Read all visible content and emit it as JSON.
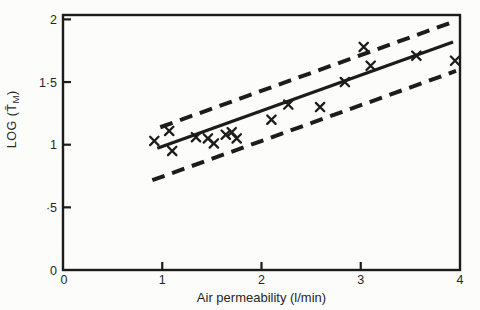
{
  "figure": {
    "background": "#fcfcfa",
    "ink": "#1c1c1c",
    "text_color": "#262626"
  },
  "chart_data": {
    "type": "scatter",
    "title": "",
    "xlabel": "Air permeability (l/min)",
    "ylabel": "LOG (T̄M)",
    "ylabel_parts": {
      "pre": "LOG (T̄",
      "sub": "M",
      "post": ")"
    },
    "xlim": [
      0,
      4
    ],
    "ylim": [
      0,
      2
    ],
    "grid": false,
    "legend": null,
    "marker": "x",
    "x_ticks": [
      {
        "value": 0,
        "label": "0"
      },
      {
        "value": 1,
        "label": "1"
      },
      {
        "value": 2,
        "label": "2"
      },
      {
        "value": 3,
        "label": "3"
      },
      {
        "value": 4,
        "label": "4"
      }
    ],
    "y_ticks": [
      {
        "value": 0,
        "label": "0"
      },
      {
        "value": 0.5,
        "label": "·5"
      },
      {
        "value": 1,
        "label": "1"
      },
      {
        "value": 1.5,
        "label": "1·5"
      },
      {
        "value": 2,
        "label": "2"
      }
    ],
    "points": [
      [
        0.92,
        1.03
      ],
      [
        1.07,
        1.11
      ],
      [
        1.1,
        0.95
      ],
      [
        1.34,
        1.06
      ],
      [
        1.46,
        1.05
      ],
      [
        1.52,
        1.01
      ],
      [
        1.64,
        1.08
      ],
      [
        1.7,
        1.1
      ],
      [
        1.75,
        1.05
      ],
      [
        2.1,
        1.2
      ],
      [
        2.27,
        1.32
      ],
      [
        2.59,
        1.3
      ],
      [
        2.84,
        1.5
      ],
      [
        3.03,
        1.78
      ],
      [
        3.1,
        1.63
      ],
      [
        3.56,
        1.71
      ],
      [
        3.95,
        1.67
      ]
    ],
    "regression_line": {
      "name": "fit-line",
      "slope": 0.285,
      "intercept": 0.7,
      "x_start": 0.95,
      "x_end": 3.93,
      "style": "solid"
    },
    "bands": [
      {
        "name": "upper-band",
        "slope": 0.285,
        "intercept": 0.86,
        "x_start": 0.98,
        "x_end": 3.95,
        "style": "dashed"
      },
      {
        "name": "lower-band",
        "slope": 0.285,
        "intercept": 0.46,
        "x_start": 0.9,
        "x_end": 3.96,
        "style": "dashed"
      }
    ]
  }
}
